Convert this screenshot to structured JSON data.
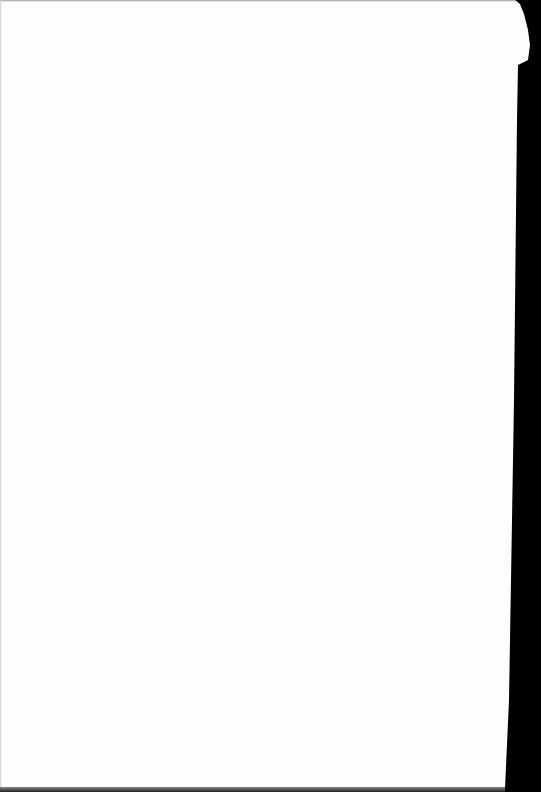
{
  "document": {
    "type": "scanned-page",
    "content": "",
    "background_color": "#fdfdfd",
    "border_color": "#000000"
  }
}
